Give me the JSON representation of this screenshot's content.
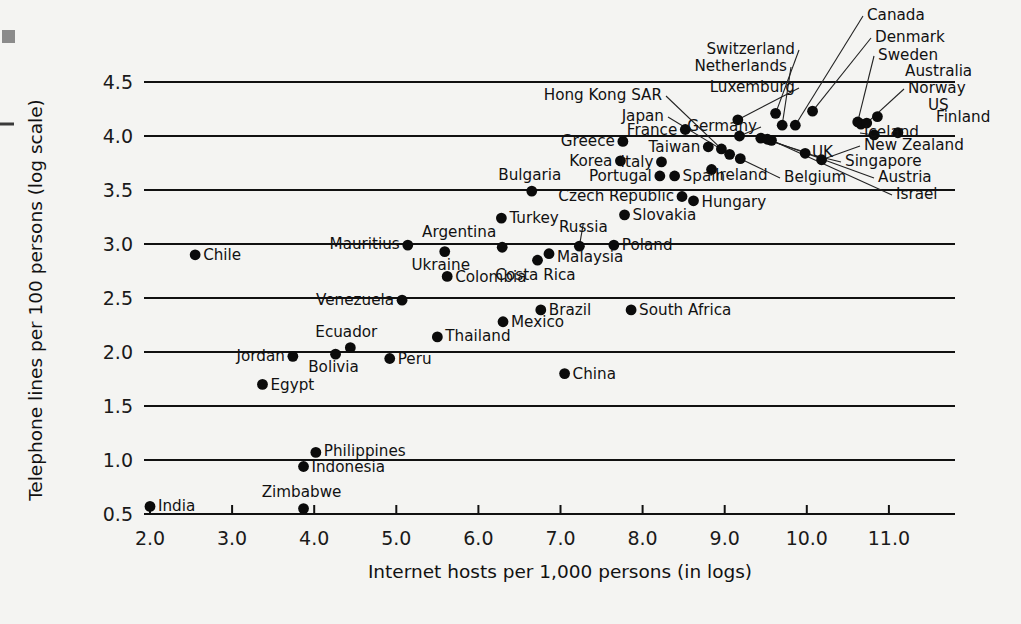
{
  "chart_data": {
    "type": "scatter",
    "title": "",
    "xlabel": "Internet hosts per 1,000 persons (in logs)",
    "ylabel": "Telephone lines per 100 persons (log scale)",
    "xlim": [
      1.55,
      11.6
    ],
    "ylim": [
      0.5,
      4.78
    ],
    "xticks": [
      "2.0",
      "3.0",
      "4.0",
      "5.0",
      "6.0",
      "7.0",
      "8.0",
      "9.0",
      "10.0",
      "11.0"
    ],
    "xtick_values": [
      2.0,
      3.0,
      4.0,
      5.0,
      6.0,
      7.0,
      8.0,
      9.0,
      10.0,
      11.0
    ],
    "yticks": [
      "0.5",
      "1.0",
      "1.5",
      "2.0",
      "2.5",
      "3.0",
      "3.5",
      "4.0",
      "4.5"
    ],
    "ytick_values": [
      0.5,
      1.0,
      1.5,
      2.0,
      2.5,
      3.0,
      3.5,
      4.0,
      4.5
    ],
    "grid": "horizontal",
    "legend": "none",
    "marker_color": "#0b0b0b",
    "points": [
      {
        "label": "India",
        "x": 2.0,
        "y": 0.57
      },
      {
        "label": "Chile",
        "x": 2.55,
        "y": 2.9
      },
      {
        "label": "Egypt",
        "x": 3.37,
        "y": 1.7
      },
      {
        "label": "Zimbabwe",
        "x": 3.87,
        "y": 0.55
      },
      {
        "label": "Indonesia",
        "x": 3.87,
        "y": 0.94
      },
      {
        "label": "Jordan",
        "x": 3.74,
        "y": 1.96
      },
      {
        "label": "Philippines",
        "x": 4.02,
        "y": 1.07
      },
      {
        "label": "Bolivia",
        "x": 4.26,
        "y": 1.98
      },
      {
        "label": "Ecuador",
        "x": 4.44,
        "y": 2.04
      },
      {
        "label": "Peru",
        "x": 4.92,
        "y": 1.94
      },
      {
        "label": "Venezuela",
        "x": 5.07,
        "y": 2.48
      },
      {
        "label": "Thailand",
        "x": 5.5,
        "y": 2.14
      },
      {
        "label": "Mauritius",
        "x": 5.14,
        "y": 2.99
      },
      {
        "label": "Ukraine",
        "x": 5.59,
        "y": 2.93
      },
      {
        "label": "Colombia",
        "x": 5.62,
        "y": 2.7
      },
      {
        "label": "Turkey",
        "x": 6.28,
        "y": 3.24
      },
      {
        "label": "Argentina",
        "x": 6.29,
        "y": 2.97
      },
      {
        "label": "Mexico",
        "x": 6.3,
        "y": 2.28
      },
      {
        "label": "Brazil",
        "x": 6.76,
        "y": 2.39
      },
      {
        "label": "Costa Rica",
        "x": 6.72,
        "y": 2.85
      },
      {
        "label": "Malaysia",
        "x": 6.86,
        "y": 2.91
      },
      {
        "label": "Bulgaria",
        "x": 6.65,
        "y": 3.49
      },
      {
        "label": "China",
        "x": 7.05,
        "y": 1.8
      },
      {
        "label": "Russia",
        "x": 7.23,
        "y": 2.98
      },
      {
        "label": "Poland",
        "x": 7.65,
        "y": 2.99
      },
      {
        "label": "Slovakia",
        "x": 7.78,
        "y": 3.27
      },
      {
        "label": "South Africa",
        "x": 7.86,
        "y": 2.39
      },
      {
        "label": "Greece",
        "x": 7.76,
        "y": 3.95
      },
      {
        "label": "Korea",
        "x": 7.73,
        "y": 3.77
      },
      {
        "label": "Italy",
        "x": 8.23,
        "y": 3.76
      },
      {
        "label": "Portugal",
        "x": 8.21,
        "y": 3.63
      },
      {
        "label": "Spain",
        "x": 8.39,
        "y": 3.63
      },
      {
        "label": "Czech Republic",
        "x": 8.48,
        "y": 3.44
      },
      {
        "label": "Hungary",
        "x": 8.62,
        "y": 3.4
      },
      {
        "label": "France",
        "x": 8.52,
        "y": 4.06
      },
      {
        "label": "Taiwan",
        "x": 8.8,
        "y": 3.9
      },
      {
        "label": "Hong Kong SAR",
        "x": 8.96,
        "y": 3.88
      },
      {
        "label": "Japan",
        "x": 9.06,
        "y": 3.83
      },
      {
        "label": "Ireland",
        "x": 8.84,
        "y": 3.69
      },
      {
        "label": "Luxemburg",
        "x": 9.16,
        "y": 4.15
      },
      {
        "label": "Germany",
        "x": 9.18,
        "y": 4.0
      },
      {
        "label": "Belgium",
        "x": 9.19,
        "y": 3.79
      },
      {
        "label": "UK",
        "x": 9.44,
        "y": 3.98
      },
      {
        "label": "Austria",
        "x": 9.52,
        "y": 3.97
      },
      {
        "label": "Israel",
        "x": 9.57,
        "y": 3.96
      },
      {
        "label": "Switzerland",
        "x": 9.62,
        "y": 4.21
      },
      {
        "label": "Netherlands",
        "x": 9.7,
        "y": 4.1
      },
      {
        "label": "Canada",
        "x": 9.86,
        "y": 4.1
      },
      {
        "label": "Singapore",
        "x": 9.98,
        "y": 3.84
      },
      {
        "label": "New Zealand",
        "x": 10.18,
        "y": 3.78
      },
      {
        "label": "Denmark",
        "x": 10.07,
        "y": 4.23
      },
      {
        "label": "Sweden",
        "x": 10.62,
        "y": 4.13
      },
      {
        "label": "Australia",
        "x": 10.66,
        "y": 4.11
      },
      {
        "label": "Norway",
        "x": 10.73,
        "y": 4.12
      },
      {
        "label": "US",
        "x": 10.86,
        "y": 4.18
      },
      {
        "label": "Iceland",
        "x": 10.82,
        "y": 4.01
      },
      {
        "label": "Finland",
        "x": 11.11,
        "y": 4.03
      }
    ]
  },
  "axis": {
    "x_title": "Internet hosts per 1,000 persons (in logs)",
    "y_title": "Telephone lines per 100 persons (log scale)"
  }
}
